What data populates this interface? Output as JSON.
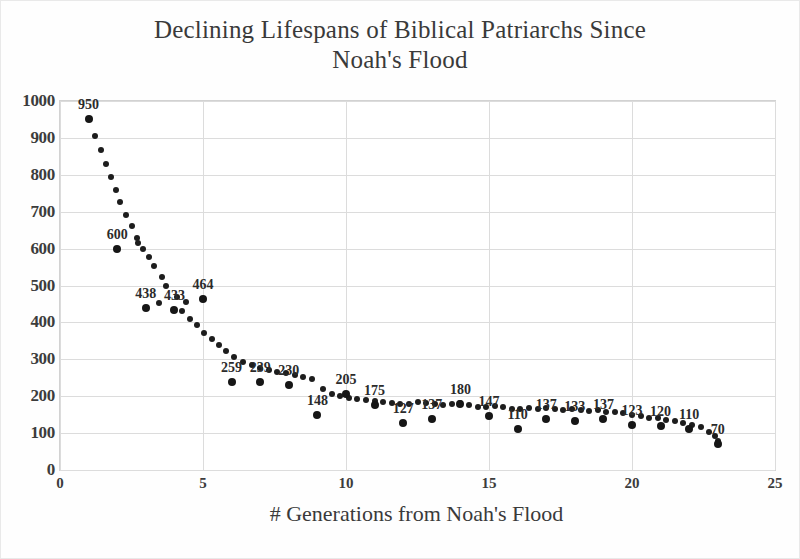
{
  "chart_data": {
    "type": "scatter",
    "title": "Declining Lifespans of Biblical Patriarchs Since\nNoah's Flood",
    "xlabel": "# Generations from Noah's Flood",
    "ylabel": "",
    "xlim": [
      0,
      25
    ],
    "ylim": [
      0,
      1000
    ],
    "xticks": [
      0,
      5,
      10,
      15,
      20,
      25
    ],
    "yticks": [
      0,
      100,
      200,
      300,
      400,
      500,
      600,
      700,
      800,
      900,
      1000
    ],
    "grid": true,
    "legend": "none",
    "annotations": [
      {
        "name": "r-squared",
        "text": "R² = 0.9601"
      }
    ],
    "x": [
      1,
      2,
      3,
      4,
      5,
      6,
      7,
      8,
      9,
      10,
      11,
      12,
      13,
      14,
      15,
      16,
      17,
      18,
      19,
      20,
      21,
      22,
      23
    ],
    "values": [
      950,
      600,
      438,
      433,
      464,
      239,
      239,
      230,
      148,
      205,
      175,
      127,
      137,
      180,
      147,
      110,
      137,
      133,
      137,
      123,
      120,
      110,
      70
    ],
    "labels": [
      "950",
      "600",
      "438",
      "433",
      "464",
      "259",
      "239",
      "230",
      "148",
      "205",
      "175",
      "127",
      "137",
      "180",
      "147",
      "110",
      "137",
      "133",
      "137",
      "123",
      "120",
      "110",
      "70"
    ],
    "trend": {
      "name": "fitted-decay-curve",
      "points": [
        [
          1.0,
          950
        ],
        [
          1.22,
          905
        ],
        [
          1.42,
          868
        ],
        [
          1.6,
          830
        ],
        [
          1.78,
          795
        ],
        [
          1.95,
          760
        ],
        [
          2.1,
          725
        ],
        [
          2.3,
          690
        ],
        [
          2.5,
          660
        ],
        [
          2.68,
          630
        ],
        [
          2.72,
          614
        ],
        [
          2.9,
          600
        ],
        [
          3.1,
          576
        ],
        [
          3.3,
          552
        ],
        [
          3.55,
          522
        ],
        [
          3.72,
          498
        ],
        [
          3.0,
          438
        ],
        [
          3.45,
          452
        ],
        [
          4.0,
          433
        ],
        [
          4.25,
          430
        ],
        [
          4.1,
          470
        ],
        [
          4.4,
          455
        ],
        [
          4.55,
          408
        ],
        [
          4.8,
          392
        ],
        [
          5.05,
          372
        ],
        [
          5.3,
          356
        ],
        [
          5.55,
          340
        ],
        [
          5.8,
          322
        ],
        [
          6.1,
          306
        ],
        [
          6.4,
          292
        ],
        [
          6.7,
          284
        ],
        [
          7.0,
          276
        ],
        [
          7.3,
          270
        ],
        [
          7.6,
          266
        ],
        [
          7.9,
          262
        ],
        [
          8.2,
          258
        ],
        [
          8.5,
          252
        ],
        [
          8.8,
          246
        ],
        [
          9.2,
          220
        ],
        [
          9.5,
          206
        ],
        [
          9.8,
          200
        ],
        [
          10.1,
          196
        ],
        [
          10.4,
          192
        ],
        [
          10.7,
          190
        ],
        [
          11.0,
          188
        ],
        [
          11.3,
          184
        ],
        [
          11.6,
          182
        ],
        [
          11.9,
          180
        ],
        [
          12.2,
          178
        ],
        [
          12.5,
          184
        ],
        [
          12.8,
          182
        ],
        [
          13.1,
          178
        ],
        [
          13.4,
          176
        ],
        [
          13.7,
          178
        ],
        [
          14.0,
          182
        ],
        [
          14.3,
          176
        ],
        [
          14.6,
          172
        ],
        [
          14.9,
          170
        ],
        [
          15.2,
          174
        ],
        [
          15.5,
          170
        ],
        [
          15.8,
          166
        ],
        [
          16.1,
          164
        ],
        [
          16.4,
          168
        ],
        [
          16.7,
          166
        ],
        [
          17.0,
          168
        ],
        [
          17.3,
          164
        ],
        [
          17.6,
          162
        ],
        [
          17.9,
          166
        ],
        [
          18.2,
          162
        ],
        [
          18.5,
          160
        ],
        [
          18.8,
          162
        ],
        [
          19.1,
          158
        ],
        [
          19.4,
          156
        ],
        [
          19.7,
          154
        ],
        [
          20.0,
          150
        ],
        [
          20.3,
          146
        ],
        [
          20.6,
          142
        ],
        [
          20.9,
          140
        ],
        [
          21.2,
          136
        ],
        [
          21.5,
          132
        ],
        [
          21.8,
          128
        ],
        [
          22.1,
          122
        ],
        [
          22.4,
          116
        ],
        [
          22.7,
          104
        ],
        [
          22.9,
          92
        ],
        [
          23.0,
          78
        ]
      ]
    }
  },
  "axis": {
    "y_labels": [
      "1000",
      "900",
      "800",
      "700",
      "600",
      "500",
      "400",
      "300",
      "200",
      "100",
      "0"
    ],
    "x_labels": [
      "0",
      "5",
      "10",
      "15",
      "20",
      "25"
    ]
  }
}
